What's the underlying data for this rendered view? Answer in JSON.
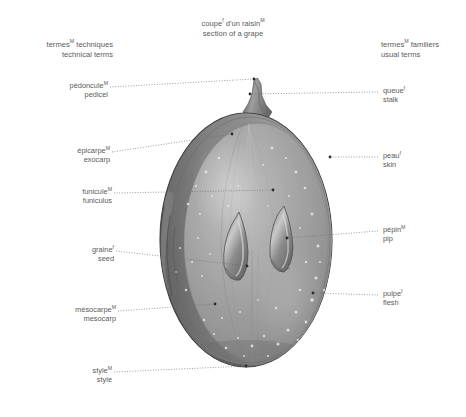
{
  "title": {
    "fr": "coupe",
    "fr_sup": "f",
    "fr_rest": " d'un raisin",
    "fr_sup2": "M",
    "en": "section of a grape"
  },
  "headers": {
    "left": {
      "fr": "termes",
      "fr_sup": "M",
      "fr_rest": " techniques",
      "en": "technical terms"
    },
    "right": {
      "fr": "termes",
      "fr_sup": "M",
      "fr_rest": " familiers",
      "en": "usual terms"
    }
  },
  "labels_left": [
    {
      "fr": "pédoncule",
      "sup": "M",
      "en": "pedicel",
      "name": "pedicel"
    },
    {
      "fr": "épicarpe",
      "sup": "M",
      "en": "exocarp",
      "name": "exocarp"
    },
    {
      "fr": "funicule",
      "sup": "M",
      "en": "funiculus",
      "name": "funiculus"
    },
    {
      "fr": "graine",
      "sup": "f",
      "en": "seed",
      "name": "seed"
    },
    {
      "fr": "mésocarpe",
      "sup": "M",
      "en": "mesocarp",
      "name": "mesocarp"
    },
    {
      "fr": "style",
      "sup": "M",
      "en": "style",
      "name": "style"
    }
  ],
  "labels_right": [
    {
      "fr": "queue",
      "sup": "f",
      "en": "stalk",
      "name": "stalk"
    },
    {
      "fr": "peau",
      "sup": "f",
      "en": "skin",
      "name": "skin"
    },
    {
      "fr": "pépin",
      "sup": "M",
      "en": "pip",
      "name": "pip"
    },
    {
      "fr": "pulpe",
      "sup": "f",
      "en": "flesh",
      "name": "flesh"
    }
  ],
  "colors": {
    "text": "#5a5a5a",
    "leader": "#6d6d6d",
    "grape_light": "#b7b7b7",
    "grape_mid": "#9a9a9a",
    "grape_dark": "#6f6f6f",
    "grape_edge": "#3f3f3f",
    "seed": "#7b7b7b",
    "background": "#ffffff"
  }
}
